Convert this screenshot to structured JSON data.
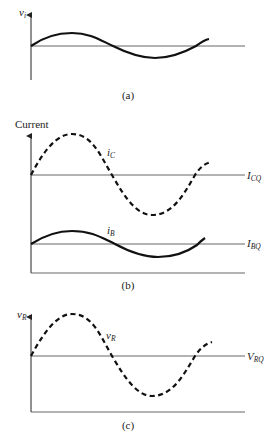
{
  "panels": [
    {
      "id": "a",
      "caption": "(a)",
      "y_axis_label": "v",
      "y_axis_label_sub": "i",
      "signals": [
        {
          "name": "v_i",
          "style": "solid",
          "baseline_label": ""
        }
      ]
    },
    {
      "id": "b",
      "caption": "(b)",
      "y_axis_label": "Current",
      "signals": [
        {
          "name": "i_C",
          "label": "i",
          "label_sub": "C",
          "style": "dashed",
          "baseline_label": "I",
          "baseline_sub": "CQ"
        },
        {
          "name": "i_B",
          "label": "i",
          "label_sub": "B",
          "style": "solid",
          "baseline_label": "I",
          "baseline_sub": "BQ"
        }
      ]
    },
    {
      "id": "c",
      "caption": "(c)",
      "y_axis_label": "v",
      "y_axis_label_sub": "R",
      "signals": [
        {
          "name": "v_R",
          "label": "v",
          "label_sub": "R",
          "style": "dashed",
          "baseline_label": "V",
          "baseline_sub": "RQ"
        }
      ]
    }
  ],
  "colors": {
    "ink": "#1a1a1a",
    "baseline": "#555555"
  }
}
